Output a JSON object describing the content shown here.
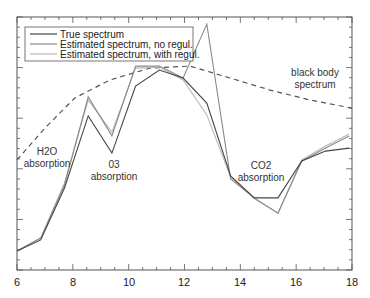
{
  "chart_data": {
    "type": "line",
    "title": "",
    "xlabel": "",
    "ylabel": "",
    "xlim": [
      6,
      18
    ],
    "ylim": [
      0,
      1
    ],
    "grid": false,
    "legend_position": "upper-left",
    "x_ticks": [
      "6",
      "8",
      "10",
      "12",
      "14",
      "16",
      "18"
    ],
    "x": [
      6.0,
      6.85,
      7.7,
      8.55,
      9.4,
      10.25,
      11.1,
      11.95,
      12.8,
      13.65,
      14.5,
      15.35,
      16.2,
      17.05,
      17.9
    ],
    "series": [
      {
        "name": "True spectrum",
        "color": "#444444",
        "values": [
          0.075,
          0.119,
          0.324,
          0.609,
          0.462,
          0.727,
          0.79,
          0.759,
          0.66,
          0.372,
          0.285,
          0.285,
          0.431,
          0.47,
          0.482
        ]
      },
      {
        "name": "Estimated spectrum, no regul.",
        "color": "#8a8a8a",
        "values": [
          0.075,
          0.126,
          0.336,
          0.684,
          0.53,
          0.806,
          0.806,
          0.759,
          0.972,
          0.36,
          0.285,
          0.225,
          0.431,
          0.482,
          0.53
        ]
      },
      {
        "name": "Estimated spectrum, with regul.",
        "color": "#b8b8b8",
        "values": [
          0.075,
          0.126,
          0.344,
          0.672,
          0.545,
          0.798,
          0.802,
          0.751,
          0.613,
          0.368,
          0.281,
          0.225,
          0.435,
          0.49,
          0.538
        ]
      },
      {
        "name": "black body spectrum",
        "style": "dashed",
        "color": "#555555",
        "x": [
          6.0,
          7.0,
          8.07,
          9.33,
          10.76,
          12.2,
          13.63,
          15.07,
          16.5,
          18.0
        ],
        "values": [
          0.435,
          0.561,
          0.68,
          0.751,
          0.798,
          0.806,
          0.759,
          0.711,
          0.672,
          0.64
        ]
      }
    ],
    "annotations": [
      {
        "text": [
          "H2O",
          "absorption"
        ],
        "x": 7.0,
        "y": 0.42
      },
      {
        "text": [
          "03",
          "absorption"
        ],
        "x": 9.5,
        "y": 0.34
      },
      {
        "text": [
          "CO2",
          "absorption"
        ],
        "x": 15.0,
        "y": 0.4
      },
      {
        "text": [
          "black body",
          "spectrum"
        ],
        "x": 16.6,
        "y": 0.8
      }
    ]
  },
  "legend": {
    "items": [
      {
        "label": "True spectrum",
        "color": "#444444"
      },
      {
        "label": "Estimated spectrum, no regul.",
        "color": "#8a8a8a"
      },
      {
        "label": "Estimated spectrum, with regul.",
        "color": "#b8b8b8"
      }
    ]
  },
  "annotations": {
    "h2o_line1": "H2O",
    "h2o_line2": "absorption",
    "o3_line1": "03",
    "o3_line2": "absorption",
    "co2_line1": "CO2",
    "co2_line2": "absorption",
    "bb_line1": "black body",
    "bb_line2": "spectrum"
  },
  "axis": {
    "x_ticks": [
      "6",
      "8",
      "10",
      "12",
      "14",
      "16",
      "18"
    ]
  }
}
